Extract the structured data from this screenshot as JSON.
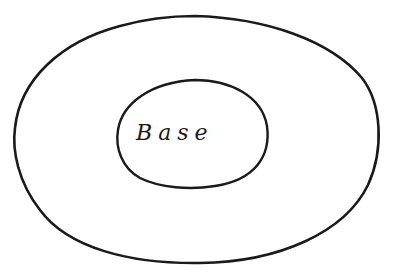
{
  "diagram": {
    "type": "nested-ellipses",
    "ink_color": "#1a1a1a",
    "background_color": "#ffffff",
    "shapes": [
      {
        "name": "outer-ellipse",
        "label": ""
      },
      {
        "name": "inner-ellipse",
        "label": "Base"
      }
    ],
    "inner_label": "Base"
  }
}
